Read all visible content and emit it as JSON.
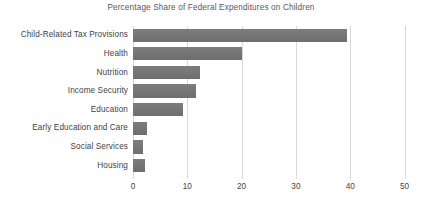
{
  "chart_data": {
    "type": "bar",
    "orientation": "horizontal",
    "title": "Percentage Share of Federal Expenditures on Children",
    "xlabel": "",
    "ylabel": "",
    "xlim": [
      0,
      50
    ],
    "xticks": [
      "0",
      "10",
      "20",
      "30",
      "40",
      "50"
    ],
    "xtick_values": [
      0,
      10,
      20,
      30,
      40,
      50
    ],
    "grid": "vertical",
    "legend": "none",
    "bar_color": "#767676",
    "gridline_color": "#d9d9d9",
    "background_color": "#ffffff",
    "categories": [
      "Child-Related Tax Provisions",
      "Health",
      "Nutrition",
      "Income Security",
      "Education",
      "Early Education and Care",
      "Social Services",
      "Housing"
    ],
    "values": [
      39.5,
      20,
      12.3,
      11.6,
      9.2,
      2.6,
      1.9,
      2.2
    ],
    "series": [
      {
        "name": "Percentage Share",
        "values": [
          39.5,
          20,
          12.3,
          11.6,
          9.2,
          2.6,
          1.9,
          2.2
        ]
      }
    ]
  }
}
